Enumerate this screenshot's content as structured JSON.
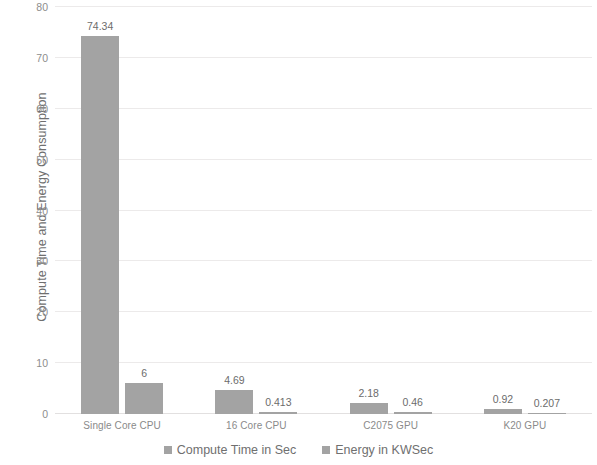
{
  "chart_data": {
    "type": "bar",
    "title": "",
    "xlabel": "",
    "ylabel": "Compute Time and Energy Consumption",
    "ylim": [
      0,
      80
    ],
    "ytick_labels": [
      "0",
      "10",
      "20",
      "30",
      "40",
      "50",
      "60",
      "70",
      "80"
    ],
    "ytick_values": [
      0,
      10,
      20,
      30,
      40,
      50,
      60,
      70,
      80
    ],
    "grid": true,
    "legend_position": "bottom",
    "categories": [
      "Single Core CPU",
      "16 Core CPU",
      "C2075 GPU",
      "K20 GPU"
    ],
    "series": [
      {
        "name": "Compute Time in Sec",
        "color": "#a3a3a3",
        "values": [
          74.34,
          4.69,
          2.18,
          0.92
        ],
        "value_labels": [
          "74.34",
          "4.69",
          "2.18",
          "0.92"
        ]
      },
      {
        "name": "Energy in KWSec",
        "color": "#a3a3a3",
        "values": [
          6,
          0.413,
          0.46,
          0.207
        ],
        "value_labels": [
          "6",
          "0.413",
          "0.46",
          "0.207"
        ]
      }
    ]
  },
  "legend": {
    "items": [
      {
        "label": "Compute Time in Sec"
      },
      {
        "label": "Energy in KWSec"
      }
    ]
  },
  "axis": {
    "y_title": "Compute Time and Energy Consumption"
  }
}
